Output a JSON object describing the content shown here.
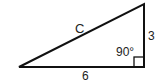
{
  "diagram": {
    "type": "right-triangle",
    "labels": {
      "hypotenuse": "C",
      "vertical_side": "3",
      "base": "6",
      "right_angle": "90°"
    },
    "colors": {
      "stroke": "#111111",
      "text": "#222222",
      "background": "#ffffff"
    }
  }
}
